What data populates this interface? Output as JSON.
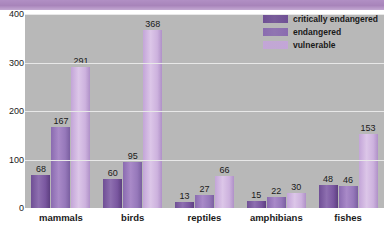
{
  "chart_data": {
    "type": "bar",
    "title": "",
    "xlabel": "",
    "ylabel": "",
    "ylim": [
      0,
      400
    ],
    "grid": true,
    "legend_position": "top-right",
    "categories": [
      "mammals",
      "birds",
      "reptiles",
      "amphibians",
      "fishes"
    ],
    "yticks": [
      "0",
      "100",
      "200",
      "300",
      "400"
    ],
    "series": [
      {
        "name": "critically endangered",
        "color": "#6f4f95",
        "values": [
          68,
          60,
          13,
          15,
          48
        ]
      },
      {
        "name": "endangered",
        "color": "#8a6bb0",
        "values": [
          167,
          95,
          27,
          22,
          46
        ]
      },
      {
        "name": "vulnerable",
        "color": "#c3a5d8",
        "values": [
          291,
          368,
          66,
          30,
          153
        ]
      }
    ]
  },
  "axis": {
    "y_ticks": [
      {
        "label": "400",
        "value": 400
      },
      {
        "label": "300",
        "value": 300
      },
      {
        "label": "200",
        "value": 200
      },
      {
        "label": "100",
        "value": 100
      },
      {
        "label": "0",
        "value": 0
      }
    ]
  },
  "legend": {
    "items": [
      {
        "label": "critically endangered",
        "color": "#6f4f95"
      },
      {
        "label": "endangered",
        "color": "#8a6bb0"
      },
      {
        "label": "vulnerable",
        "color": "#c3a5d8"
      }
    ]
  },
  "colors": {
    "plot_background": "#b8b8b8",
    "page_background": "#ffffff",
    "banner": "#ab88bf",
    "gridline": "#e8e8e8",
    "text": "#1a1a1a"
  }
}
